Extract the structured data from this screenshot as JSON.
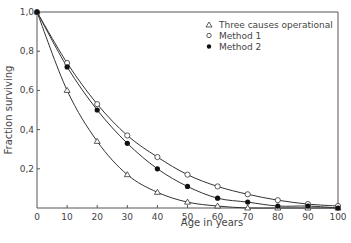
{
  "chart_data": {
    "type": "line",
    "title": "",
    "xlabel": "Age in years",
    "ylabel": "Fraction surviving",
    "xlim": [
      0,
      100
    ],
    "ylim": [
      0,
      1.0
    ],
    "x_ticks": [
      "0",
      "10",
      "20",
      "30",
      "40",
      "50",
      "60",
      "70",
      "80",
      "90",
      "100"
    ],
    "y_ticks": [
      "0,2",
      "0,4",
      "0,6",
      "0,8",
      "1,0"
    ],
    "grid": false,
    "legend_position": "upper right",
    "x": [
      0,
      10,
      20,
      30,
      40,
      50,
      60,
      70,
      80,
      90,
      100
    ],
    "series": [
      {
        "name": "Three causes operational",
        "marker": "open-triangle",
        "values": [
          1.0,
          0.6,
          0.34,
          0.17,
          0.08,
          0.03,
          0.01,
          0.0,
          0.0,
          0.0,
          0.0
        ]
      },
      {
        "name": "Method 1",
        "marker": "open-circle",
        "values": [
          1.0,
          0.74,
          0.53,
          0.37,
          0.26,
          0.17,
          0.11,
          0.07,
          0.04,
          0.02,
          0.01
        ]
      },
      {
        "name": "Method 2",
        "marker": "filled-circle",
        "values": [
          1.0,
          0.72,
          0.5,
          0.33,
          0.2,
          0.11,
          0.05,
          0.03,
          0.01,
          0.01,
          0.0
        ]
      }
    ]
  },
  "legend": {
    "items": [
      {
        "symbol": "△",
        "label": "Three causes operational"
      },
      {
        "symbol": "○",
        "label": "Method 1"
      },
      {
        "symbol": "●",
        "label": "Method 2"
      }
    ]
  }
}
